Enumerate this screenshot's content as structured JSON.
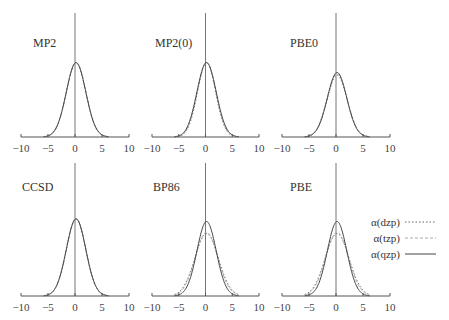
{
  "chart_data": [
    {
      "type": "line",
      "title": "MP2",
      "x_ticks": [
        -10,
        -5,
        0,
        5,
        10
      ],
      "xlim": [
        -10,
        10
      ],
      "series": [
        {
          "name": "α(dzp)",
          "peak": 0.6,
          "sigma": 1.8
        },
        {
          "name": "α(tzp)",
          "peak": 0.6,
          "sigma": 1.8
        },
        {
          "name": "α(qzp)",
          "peak": 0.6,
          "sigma": 1.8
        }
      ]
    },
    {
      "type": "line",
      "title": "MP2(0)",
      "x_ticks": [
        -10,
        -5,
        0,
        5,
        10
      ],
      "xlim": [
        -10,
        10
      ],
      "series": [
        {
          "name": "α(dzp)",
          "peak": 0.6,
          "sigma": 1.7
        },
        {
          "name": "α(tzp)",
          "peak": 0.6,
          "sigma": 1.75
        },
        {
          "name": "α(qzp)",
          "peak": 0.6,
          "sigma": 1.8
        }
      ]
    },
    {
      "type": "line",
      "title": "PBE0",
      "x_ticks": [
        -10,
        -5,
        0,
        5,
        10
      ],
      "xlim": [
        -10,
        10
      ],
      "series": [
        {
          "name": "α(dzp)",
          "peak": 0.5,
          "sigma": 1.85
        },
        {
          "name": "α(tzp)",
          "peak": 0.51,
          "sigma": 1.85
        },
        {
          "name": "α(qzp)",
          "peak": 0.52,
          "sigma": 1.8
        }
      ]
    },
    {
      "type": "line",
      "title": "CCSD",
      "x_ticks": [
        -10,
        -5,
        0,
        5,
        10
      ],
      "xlim": [
        -10,
        10
      ],
      "series": [
        {
          "name": "α(dzp)",
          "peak": 0.58,
          "sigma": 1.8
        },
        {
          "name": "α(tzp)",
          "peak": 0.58,
          "sigma": 1.8
        },
        {
          "name": "α(qzp)",
          "peak": 0.58,
          "sigma": 1.8
        }
      ]
    },
    {
      "type": "line",
      "title": "BP86",
      "x_ticks": [
        -10,
        -5,
        0,
        5,
        10
      ],
      "xlim": [
        -10,
        10
      ],
      "series": [
        {
          "name": "α(dzp)",
          "peak": 0.47,
          "sigma": 2.2
        },
        {
          "name": "α(tzp)",
          "peak": 0.48,
          "sigma": 2.1
        },
        {
          "name": "α(qzp)",
          "peak": 0.56,
          "sigma": 1.8
        }
      ]
    },
    {
      "type": "line",
      "title": "PBE",
      "x_ticks": [
        -10,
        -5,
        0,
        5,
        10
      ],
      "xlim": [
        -10,
        10
      ],
      "series": [
        {
          "name": "α(dzp)",
          "peak": 0.47,
          "sigma": 2.2
        },
        {
          "name": "α(tzp)",
          "peak": 0.48,
          "sigma": 2.1
        },
        {
          "name": "α(qzp)",
          "peak": 0.56,
          "sigma": 1.8
        }
      ]
    }
  ],
  "legend": {
    "items": [
      {
        "label": "α(dzp)",
        "style": "dotted"
      },
      {
        "label": "α(tzp)",
        "style": "dashed"
      },
      {
        "label": "α(qzp)",
        "style": "solid"
      }
    ]
  },
  "panels": [
    {
      "title": "MP2"
    },
    {
      "title": "MP2(0)"
    },
    {
      "title": "PBE0"
    },
    {
      "title": "CCSD"
    },
    {
      "title": "BP86"
    },
    {
      "title": "PBE"
    }
  ],
  "tick_labels": [
    "−10",
    "−5",
    "0",
    "5",
    "10"
  ],
  "colors": {
    "curve": "#444444",
    "axis": "#555555",
    "dashed": "#999999"
  }
}
